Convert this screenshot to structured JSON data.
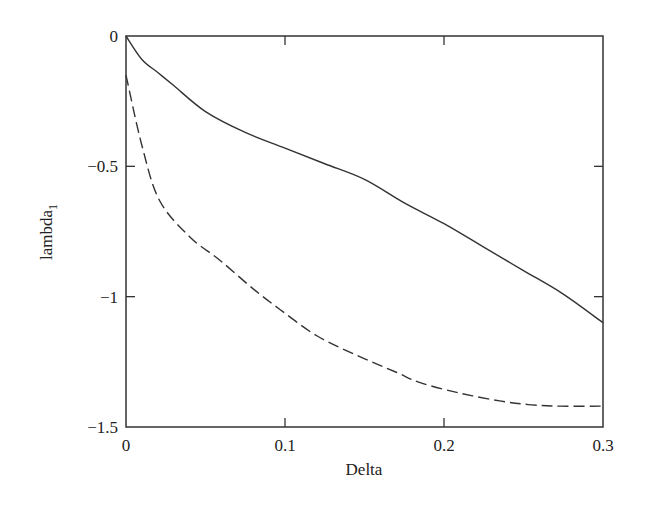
{
  "chart_data": {
    "type": "line",
    "title": "",
    "xlabel": "Delta",
    "ylabel": "lambda",
    "ylabel_subscript": "1",
    "xlim": [
      0,
      0.3
    ],
    "ylim": [
      -1.5,
      0
    ],
    "xticks": [
      0,
      0.1,
      0.2,
      0.3
    ],
    "xtick_labels": [
      "0",
      "0.1",
      "0.2",
      "0.3"
    ],
    "yticks": [
      0,
      -0.5,
      -1,
      -1.5
    ],
    "ytick_labels": [
      "0",
      "-0.5",
      "-1",
      "-1.5"
    ],
    "grid": false,
    "legend": null,
    "series": [
      {
        "name": "solid",
        "style": "solid",
        "x": [
          0,
          0.01,
          0.02,
          0.03,
          0.05,
          0.075,
          0.1,
          0.125,
          0.15,
          0.175,
          0.2,
          0.225,
          0.25,
          0.275,
          0.3
        ],
        "y": [
          0,
          -0.09,
          -0.14,
          -0.19,
          -0.29,
          -0.37,
          -0.43,
          -0.49,
          -0.55,
          -0.64,
          -0.72,
          -0.81,
          -0.9,
          -0.99,
          -1.1
        ]
      },
      {
        "name": "dashed",
        "style": "dashed",
        "x": [
          0,
          0.01,
          0.021,
          0.04,
          0.059,
          0.08,
          0.097,
          0.12,
          0.147,
          0.17,
          0.185,
          0.21,
          0.235,
          0.255,
          0.273,
          0.3
        ],
        "y": [
          -0.15,
          -0.42,
          -0.63,
          -0.77,
          -0.86,
          -0.97,
          -1.05,
          -1.15,
          -1.23,
          -1.29,
          -1.33,
          -1.37,
          -1.4,
          -1.415,
          -1.42,
          -1.42
        ]
      }
    ]
  }
}
